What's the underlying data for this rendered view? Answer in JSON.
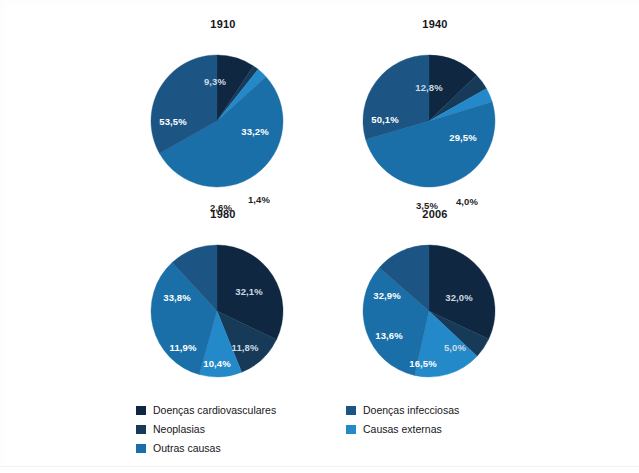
{
  "page": {
    "background_color": "#ffffff",
    "top_caption_fragment": ""
  },
  "palette": {
    "doencas_cardiovasculares": "#0f2740",
    "neoplasias": "#173a58",
    "doencas_infecciosas": "#1a5party",
    "infecciosas": "#1c5584",
    "outras_causas": "#1b6fa8",
    "causas_externas": "#2489c9"
  },
  "legend": {
    "columns": [
      {
        "items": [
          {
            "label": "Doenças cardiovasculares",
            "color": "#0f2740",
            "key": "cardio"
          },
          {
            "label": "Neoplasias",
            "color": "#173a58",
            "key": "neoplasias"
          },
          {
            "label": "Outras causas",
            "color": "#1b6fa8",
            "key": "outras"
          }
        ]
      },
      {
        "items": [
          {
            "label": "Doenças infecciosas",
            "color": "#1c5584",
            "key": "infecciosas"
          },
          {
            "label": "Causas externas",
            "color": "#2489c9",
            "key": "externas"
          }
        ]
      }
    ]
  },
  "chart_data": [
    {
      "type": "pie",
      "title": "1910",
      "categories": [
        "Doenças cardiovasculares",
        "Neoplasias",
        "Causas externas",
        "Outras causas",
        "Doenças infecciosas"
      ],
      "values": [
        9.3,
        1.4,
        2.6,
        53.5,
        33.2
      ],
      "labels": [
        "9,3%",
        "1,4%",
        "2,6%",
        "53,5%",
        "33,2%"
      ],
      "colors": [
        "#0f2740",
        "#173a58",
        "#2489c9",
        "#1b6fa8",
        "#1c5584"
      ],
      "legend_position": "bottom",
      "units": "percent"
    },
    {
      "type": "pie",
      "title": "1940",
      "categories": [
        "Doenças cardiovasculares",
        "Neoplasias",
        "Causas externas",
        "Outras causas",
        "Doenças infecciosas"
      ],
      "values": [
        12.8,
        4.0,
        3.5,
        50.1,
        29.5
      ],
      "labels": [
        "12,8%",
        "4,0%",
        "3,5%",
        "50,1%",
        "29,5%"
      ],
      "colors": [
        "#0f2740",
        "#173a58",
        "#2489c9",
        "#1b6fa8",
        "#1c5584"
      ],
      "legend_position": "bottom",
      "units": "percent"
    },
    {
      "type": "pie",
      "title": "1980",
      "categories": [
        "Doenças cardiovasculares",
        "Neoplasias",
        "Causas externas",
        "Outras causas",
        "Doenças infecciosas"
      ],
      "values": [
        32.1,
        11.8,
        10.4,
        33.8,
        11.9
      ],
      "labels": [
        "32,1%",
        "11,8%",
        "10,4%",
        "33,8%",
        "11,9%"
      ],
      "colors": [
        "#0f2740",
        "#173a58",
        "#2489c9",
        "#1b6fa8",
        "#1c5584"
      ],
      "legend_position": "bottom",
      "units": "percent"
    },
    {
      "type": "pie",
      "title": "2006",
      "categories": [
        "Doenças cardiovasculares",
        "Neoplasias",
        "Causas externas",
        "Outras causas",
        "Doenças infecciosas"
      ],
      "values": [
        32.0,
        5.0,
        16.5,
        32.9,
        13.6
      ],
      "labels": [
        "32,0%",
        "5,0%",
        "16,5%",
        "32,9%",
        "13,6%"
      ],
      "colors": [
        "#0f2740",
        "#173a58",
        "#2489c9",
        "#1b6fa8",
        "#1c5584"
      ],
      "legend_position": "bottom",
      "units": "percent"
    }
  ],
  "charts_layout": [
    {
      "title_key": 0,
      "left": 148,
      "top": 18,
      "cx": 69,
      "cy": 88,
      "r": 66,
      "label_placement": [
        {
          "idx": 0,
          "mode": "in",
          "dx": -2,
          "dy": -36
        },
        {
          "idx": 1,
          "mode": "out",
          "dx": 42,
          "dy": 82
        },
        {
          "idx": 2,
          "mode": "out",
          "dx": 4,
          "dy": 90
        },
        {
          "idx": 3,
          "mode": "in",
          "dx": -44,
          "dy": 4
        },
        {
          "idx": 4,
          "mode": "in",
          "dx": 38,
          "dy": 14
        }
      ]
    },
    {
      "title_key": 1,
      "left": 360,
      "top": 18,
      "cx": 69,
      "cy": 88,
      "r": 66,
      "label_placement": [
        {
          "idx": 0,
          "mode": "in",
          "dx": 0,
          "dy": -30
        },
        {
          "idx": 1,
          "mode": "out",
          "dx": 38,
          "dy": 84
        },
        {
          "idx": 2,
          "mode": "out",
          "dx": -2,
          "dy": 88
        },
        {
          "idx": 3,
          "mode": "in",
          "dx": -44,
          "dy": 2
        },
        {
          "idx": 4,
          "mode": "in",
          "dx": 34,
          "dy": 20
        }
      ]
    },
    {
      "title_key": 2,
      "left": 148,
      "top": 208,
      "cx": 69,
      "cy": 88,
      "r": 66,
      "label_placement": [
        {
          "idx": 0,
          "mode": "in",
          "dx": 32,
          "dy": -16
        },
        {
          "idx": 1,
          "mode": "in",
          "dx": 28,
          "dy": 40
        },
        {
          "idx": 2,
          "mode": "in",
          "dx": 0,
          "dy": 56
        },
        {
          "idx": 3,
          "mode": "in",
          "dx": -40,
          "dy": -10
        },
        {
          "idx": 4,
          "mode": "in",
          "dx": -34,
          "dy": 40
        }
      ]
    },
    {
      "title_key": 3,
      "left": 360,
      "top": 208,
      "cx": 69,
      "cy": 88,
      "r": 66,
      "label_placement": [
        {
          "idx": 0,
          "mode": "in",
          "dx": 30,
          "dy": -10
        },
        {
          "idx": 1,
          "mode": "in",
          "dx": 26,
          "dy": 40
        },
        {
          "idx": 2,
          "mode": "in",
          "dx": -6,
          "dy": 56
        },
        {
          "idx": 3,
          "mode": "in",
          "dx": -42,
          "dy": -12
        },
        {
          "idx": 4,
          "mode": "in",
          "dx": -40,
          "dy": 28
        }
      ]
    }
  ]
}
